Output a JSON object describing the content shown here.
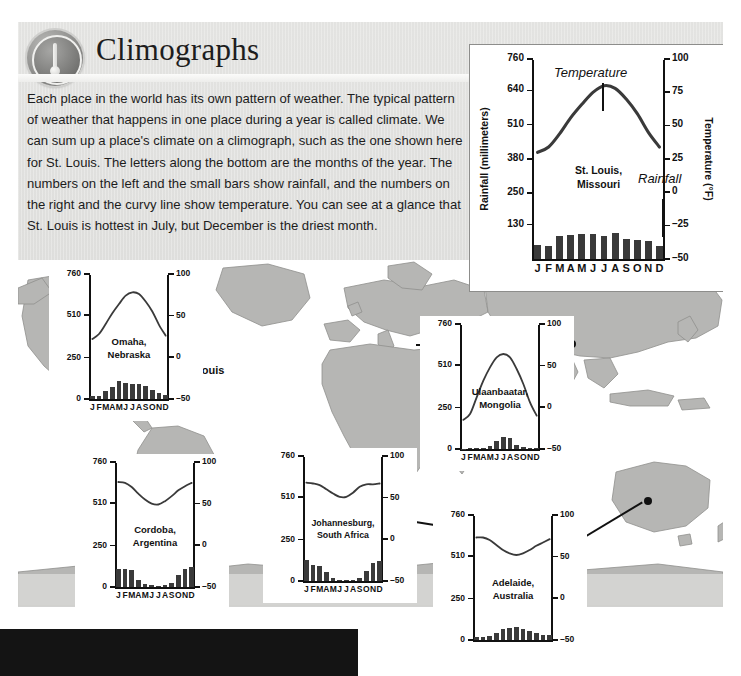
{
  "header": {
    "title": "Climographs",
    "badge_icon": "thermometer-icon"
  },
  "body_text": "Each place in the world has its own pattern of weather. The typical pattern of weather that happens in one place during a year is called climate. We can sum up a place's climate on a climograph, such as the one shown here for St. Louis. The letters along the bottom are the months of the year. The numbers on the left and the small bars show rainfall, and the numbers on the right and the curvy line show temperature. You can see at a glance that St. Louis is hottest in July, but December is the driest month.",
  "map": {
    "labels": [
      {
        "name": "st-louis",
        "text": "St. Louis"
      }
    ]
  },
  "months": [
    "J",
    "F",
    "M",
    "A",
    "M",
    "J",
    "J",
    "A",
    "S",
    "O",
    "N",
    "D"
  ],
  "chart_data": [
    {
      "id": "st-louis",
      "type": "bar",
      "title": "St. Louis,\nMissouri",
      "title_line1": "St. Louis,",
      "title_line2": "Missouri",
      "xlabel": "",
      "ylabel": "Rainfall (millimeters)",
      "y2label": "Temperature (°F)",
      "categories": [
        "J",
        "F",
        "M",
        "A",
        "M",
        "J",
        "J",
        "A",
        "S",
        "O",
        "N",
        "D"
      ],
      "ylim": [
        0,
        760
      ],
      "yticks": [
        130,
        250,
        380,
        510,
        640,
        760
      ],
      "y2lim": [
        -50,
        100
      ],
      "y2ticks": [
        -50,
        -25,
        0,
        25,
        50,
        75,
        100
      ],
      "grid": false,
      "legend": "none",
      "annotations": [
        "Temperature",
        "Rainfall"
      ],
      "series": [
        {
          "name": "Rainfall",
          "unit": "mm",
          "values": [
            55,
            50,
            86,
            92,
            94,
            96,
            88,
            100,
            78,
            72,
            70,
            48
          ]
        },
        {
          "name": "Temperature",
          "unit": "°F",
          "values": [
            30,
            34,
            44,
            56,
            66,
            75,
            80,
            78,
            70,
            59,
            45,
            34
          ]
        }
      ]
    },
    {
      "id": "omaha",
      "type": "bar",
      "title_line1": "Omaha,",
      "title_line2": "Nebraska",
      "ylabel": "",
      "categories": [
        "J",
        "F",
        "M",
        "A",
        "M",
        "J",
        "J",
        "A",
        "S",
        "O",
        "N",
        "D"
      ],
      "ylim": [
        0,
        760
      ],
      "yticks": [
        0,
        250,
        510,
        760
      ],
      "y2lim": [
        -50,
        100
      ],
      "y2ticks": [
        -50,
        0,
        50,
        100
      ],
      "series": [
        {
          "name": "Rainfall",
          "unit": "mm",
          "values": [
            18,
            20,
            48,
            72,
            110,
            96,
            92,
            90,
            82,
            58,
            36,
            25
          ]
        },
        {
          "name": "Temperature",
          "unit": "°F",
          "values": [
            22,
            28,
            40,
            53,
            64,
            74,
            78,
            76,
            67,
            55,
            39,
            26
          ]
        }
      ]
    },
    {
      "id": "ulaanbaatar",
      "type": "bar",
      "title_line1": "Ulaanbaatar,",
      "title_line2": "Mongolia",
      "categories": [
        "J",
        "F",
        "M",
        "A",
        "M",
        "J",
        "J",
        "A",
        "S",
        "O",
        "N",
        "D"
      ],
      "ylim": [
        0,
        760
      ],
      "yticks": [
        0,
        250,
        510,
        760
      ],
      "y2lim": [
        -50,
        100
      ],
      "y2ticks": [
        -50,
        0,
        50,
        100
      ],
      "series": [
        {
          "name": "Rainfall",
          "unit": "mm",
          "values": [
            3,
            4,
            5,
            9,
            16,
            48,
            72,
            68,
            24,
            10,
            6,
            4
          ]
        },
        {
          "name": "Temperature",
          "unit": "°F",
          "values": [
            -15,
            -8,
            12,
            32,
            48,
            60,
            64,
            60,
            46,
            28,
            6,
            -10
          ]
        }
      ]
    },
    {
      "id": "cordoba",
      "type": "bar",
      "title_line1": "Cordoba,",
      "title_line2": "Argentina",
      "categories": [
        "J",
        "F",
        "M",
        "A",
        "M",
        "J",
        "J",
        "A",
        "S",
        "O",
        "N",
        "D"
      ],
      "ylim": [
        0,
        760
      ],
      "yticks": [
        0,
        250,
        510,
        760
      ],
      "y2lim": [
        -50,
        100
      ],
      "y2ticks": [
        -50,
        0,
        50,
        100
      ],
      "series": [
        {
          "name": "Rainfall",
          "unit": "mm",
          "values": [
            110,
            108,
            104,
            44,
            18,
            10,
            8,
            10,
            22,
            72,
            108,
            120
          ]
        },
        {
          "name": "Temperature",
          "unit": "°F",
          "values": [
            76,
            75,
            70,
            62,
            55,
            50,
            49,
            53,
            59,
            66,
            71,
            75
          ]
        }
      ]
    },
    {
      "id": "johannesburg",
      "type": "bar",
      "title_line1": "Johannesburg,",
      "title_line2": "South Africa",
      "categories": [
        "J",
        "F",
        "M",
        "A",
        "M",
        "J",
        "J",
        "A",
        "S",
        "O",
        "N",
        "D"
      ],
      "ylim": [
        0,
        760
      ],
      "yticks": [
        0,
        250,
        510,
        760
      ],
      "y2lim": [
        -50,
        100
      ],
      "y2ticks": [
        -50,
        0,
        50,
        100
      ],
      "series": [
        {
          "name": "Rainfall",
          "unit": "mm",
          "values": [
            125,
            100,
            92,
            52,
            16,
            7,
            6,
            7,
            20,
            62,
            108,
            122
          ]
        },
        {
          "name": "Temperature",
          "unit": "°F",
          "values": [
            68,
            67,
            65,
            60,
            55,
            51,
            51,
            56,
            63,
            66,
            66,
            67
          ]
        }
      ]
    },
    {
      "id": "adelaide",
      "type": "bar",
      "title_line1": "Adelaide,",
      "title_line2": "Australia",
      "categories": [
        "J",
        "F",
        "M",
        "A",
        "M",
        "J",
        "J",
        "A",
        "S",
        "O",
        "N",
        "D"
      ],
      "ylim": [
        0,
        760
      ],
      "yticks": [
        0,
        250,
        510,
        760
      ],
      "y2lim": [
        -50,
        100
      ],
      "y2ticks": [
        -50,
        0,
        50,
        100
      ],
      "series": [
        {
          "name": "Rainfall",
          "unit": "mm",
          "values": [
            20,
            20,
            26,
            44,
            68,
            74,
            78,
            70,
            58,
            44,
            30,
            28
          ]
        },
        {
          "name": "Temperature",
          "unit": "°F",
          "values": [
            73,
            73,
            70,
            64,
            58,
            54,
            52,
            54,
            58,
            63,
            67,
            71
          ]
        }
      ]
    }
  ]
}
